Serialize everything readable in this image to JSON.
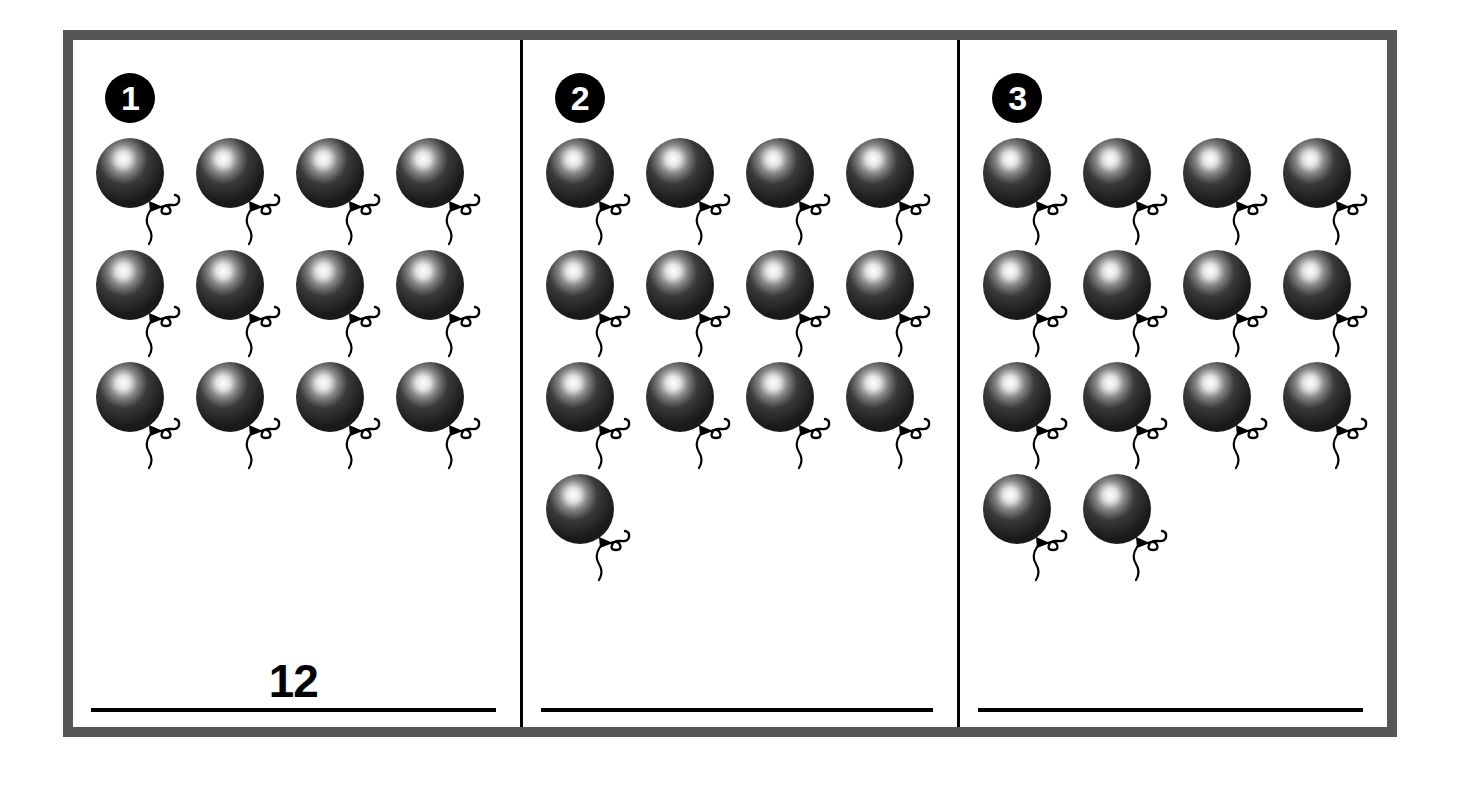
{
  "worksheet": {
    "title": "Counting Balloons Worksheet",
    "border_color": "#565656",
    "divider_color": "#000000",
    "background_color": "#ffffff"
  },
  "balloon": {
    "icon_name": "balloon-icon",
    "body_color": "#3a3a3a",
    "body_color_dark": "#1a1a1a",
    "highlight_color": "#ffffff",
    "string_color": "#000000"
  },
  "panels": [
    {
      "badge": "1",
      "badge_name": "panel-number-1",
      "rows": [
        4,
        4,
        4
      ],
      "total": 12,
      "answer_value": "12",
      "answer_filled": true
    },
    {
      "badge": "2",
      "badge_name": "panel-number-2",
      "rows": [
        4,
        4,
        4,
        1
      ],
      "total": 13,
      "answer_value": "",
      "answer_filled": false
    },
    {
      "badge": "3",
      "badge_name": "panel-number-3",
      "rows": [
        4,
        4,
        4,
        2
      ],
      "total": 14,
      "answer_value": "",
      "answer_filled": false
    }
  ]
}
